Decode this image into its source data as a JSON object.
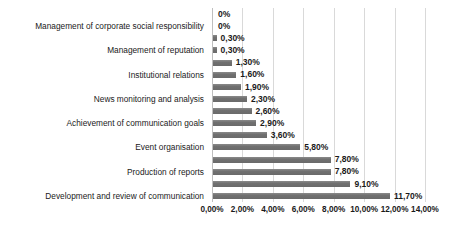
{
  "chart_data": {
    "type": "bar",
    "orientation": "horizontal",
    "title": "",
    "xlabel": "",
    "ylabel": "",
    "xlim": [
      0,
      14
    ],
    "xticks": [
      "0,00%",
      "2,00%",
      "4,00%",
      "6,00%",
      "8,00%",
      "10,00%",
      "12,00%",
      "14,00%"
    ],
    "xtick_values": [
      0,
      2,
      4,
      6,
      8,
      10,
      12,
      14
    ],
    "grid": true,
    "legend": "none",
    "bar_color": "#757575",
    "categories": [
      "",
      "Management of corporate social responsibility",
      "",
      "Management of reputation",
      "",
      "Institutional relations",
      "",
      "News monitoring and analysis",
      "",
      "Achievement of communication goals",
      "",
      "Event organisation",
      "",
      "Production of reports",
      "",
      "Development and review of communication"
    ],
    "values": [
      0,
      0,
      0.3,
      0.3,
      1.3,
      1.6,
      1.9,
      2.3,
      2.6,
      2.9,
      3.6,
      5.8,
      7.8,
      7.8,
      9.1,
      11.7
    ],
    "data_labels": [
      "0%",
      "0%",
      "0,30%",
      "0,30%",
      "1,30%",
      "1,60%",
      "1,90%",
      "2,30%",
      "2,60%",
      "2,90%",
      "3,60%",
      "5,80%",
      "7,80%",
      "7,80%",
      "9,10%",
      "11,70%"
    ]
  }
}
